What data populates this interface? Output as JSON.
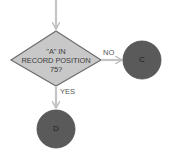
{
  "diagram": {
    "type": "flowchart-decision",
    "decision": {
      "shape": "diamond",
      "line1": "\"A\" IN",
      "line2": "RECORD POSITION",
      "line3": "75?",
      "fill": "#c8c8c8",
      "stroke": "#6e6e6e"
    },
    "branches": [
      {
        "label": "NO",
        "target": "C",
        "direction": "right"
      },
      {
        "label": "YES",
        "target": "D",
        "direction": "down"
      }
    ],
    "connectors": [
      {
        "id": "C",
        "label": "C",
        "fill": "#5a5a5a"
      },
      {
        "id": "D",
        "label": "D",
        "fill": "#5a5a5a"
      }
    ],
    "arrow_color": "#c4c4c4"
  }
}
